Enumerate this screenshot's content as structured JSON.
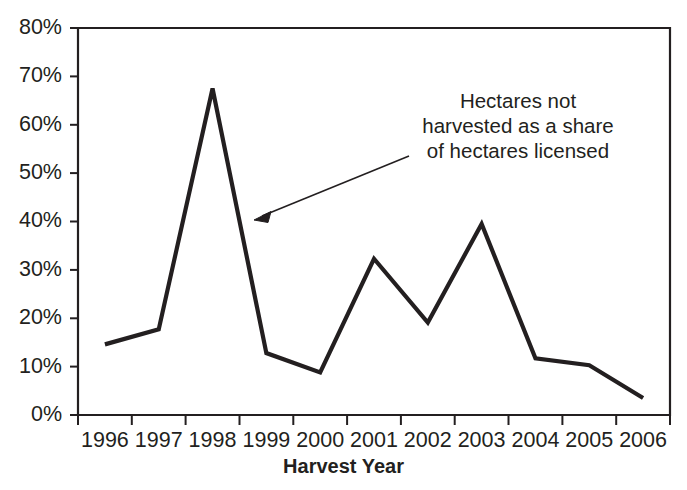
{
  "chart_data": {
    "type": "line",
    "title": "",
    "subtitle": "",
    "xlabel": "Harvest Year",
    "ylabel": "",
    "categories": [
      "1996",
      "1997",
      "1998",
      "1999",
      "2000",
      "2001",
      "2002",
      "2003",
      "2004",
      "2005",
      "2006"
    ],
    "values": [
      14.6,
      17.7,
      67.5,
      12.8,
      8.8,
      32.3,
      19.1,
      39.5,
      11.7,
      10.3,
      3.5
    ],
    "series": [
      {
        "name": "Hectares not harvested as a share of hectares licensed",
        "values": [
          14.6,
          17.7,
          67.5,
          12.8,
          8.8,
          32.3,
          19.1,
          39.5,
          11.7,
          10.3,
          3.5
        ]
      }
    ],
    "ylim": [
      0,
      80
    ],
    "ytick_values": [
      0,
      10,
      20,
      30,
      40,
      50,
      60,
      70,
      80
    ],
    "ytick_labels": [
      "0%",
      "10%",
      "20%",
      "30%",
      "40%",
      "50%",
      "60%",
      "70%",
      "80%"
    ],
    "xtick_labels": [
      "1996",
      "1997",
      "1998",
      "1999",
      "2000",
      "2001",
      "2002",
      "2003",
      "2004",
      "2005",
      "2006"
    ],
    "grid": false,
    "legend": "none",
    "value_format": "percent",
    "annotations": [
      {
        "name": "series-callout",
        "lines": [
          "Hectares not",
          "harvested as a share",
          "of hectares licensed"
        ],
        "arrow": true,
        "points_to_year": "1999"
      }
    ],
    "colors": {
      "line": "#231f20",
      "axis": "#231f20",
      "text": "#231f20",
      "background": "#ffffff"
    }
  }
}
